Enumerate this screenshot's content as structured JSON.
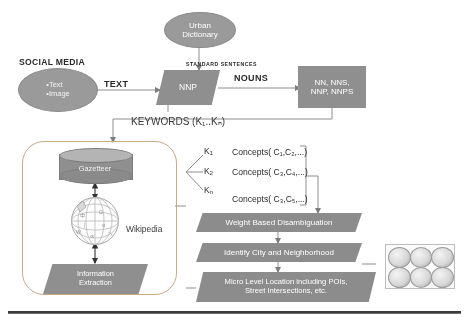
{
  "diagram": {
    "colors": {
      "shape_fill": "#8f8f8f",
      "ellipse_fill": "#9a9a9a",
      "band_fill": "#8c8c8c",
      "roundbox_border": "#c9a886",
      "text_on_shape": "#ffffff",
      "text_on_page": "#2b2b2b"
    },
    "nodes": {
      "social_media_label": "SOCIAL MEDIA",
      "social_media_items": [
        "•Text",
        "•Image"
      ],
      "urban_dictionary": "Urban\nDictionary",
      "urban_dictionary_line1": "Urban",
      "urban_dictionary_line2": "Dictionary",
      "nnp": "NNP",
      "pos_tags_line1": "NN, NNS,",
      "pos_tags_line2": "NNP, NNPS",
      "gazetteer": "Gazetteer",
      "wikipedia": "Wikipedia",
      "information_extraction_line1": "Information",
      "information_extraction_line2": "Extraction",
      "weight_based_disambiguation": "Weight Based Disambiguation",
      "identify_city_and_neighborhood": "Identify City and Neighborhood",
      "micro_level_line1": "Micro Level Location including POIs,",
      "micro_level_line2": "Street Intersections, etc."
    },
    "edges": {
      "text": "TEXT",
      "standard_sentences": "STANDARD SENTENCES",
      "nouns": "NOUNS",
      "keywords": "KEYWORDS (K₁..Kₙ)"
    },
    "concepts": [
      {
        "key": "K₁",
        "key_base": "K",
        "key_sub": "1",
        "value": "Concepts( C₁,C₂,...)"
      },
      {
        "key": "K₂",
        "key_base": "K",
        "key_sub": "2",
        "value": "Concepts( C₃,C₄,...)"
      },
      {
        "key": "Kₙ",
        "key_base": "K",
        "key_sub": "n",
        "value": "Concepts( C₃,C₅,...)"
      }
    ],
    "collage": {
      "name": "result-thumbnail-collage",
      "tiles": [
        "thumb-1",
        "thumb-2",
        "thumb-3",
        "thumb-4",
        "thumb-5",
        "thumb-6"
      ]
    }
  }
}
